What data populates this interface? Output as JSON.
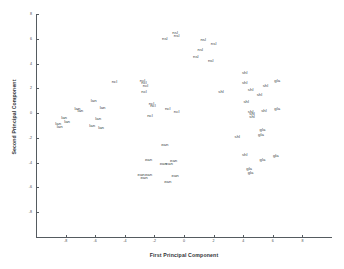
{
  "chart_data": {
    "type": "scatter",
    "title": "",
    "xlabel": "First Principal Component",
    "ylabel": "Second Principal Component",
    "xlim": [
      -10,
      10
    ],
    "ylim": [
      -10,
      8
    ],
    "xticks": [
      -8,
      -6,
      -4,
      -2,
      0,
      2,
      4,
      6,
      8
    ],
    "xtick_labels": [
      "-8",
      "-6",
      "-4",
      "-2",
      "0",
      "2",
      "4",
      "6",
      "8"
    ],
    "yticks": [
      -8,
      -6,
      -4,
      -2,
      0,
      2,
      4,
      6,
      8
    ],
    "ytick_labels": [
      "-8",
      "-6",
      "-4",
      "-2",
      "0",
      "2",
      "4",
      "6",
      "8"
    ],
    "grid": false,
    "legend": false,
    "marker": "text-label",
    "groups": [
      "lan",
      "ncl",
      "nsl",
      "ean",
      "shl",
      "gla"
    ],
    "points": [
      {
        "label": "nsl",
        "x": -0.6,
        "y": 6.5
      },
      {
        "label": "nsl",
        "x": -0.5,
        "y": 6.2
      },
      {
        "label": "nsl",
        "x": -1.3,
        "y": 6.0
      },
      {
        "label": "nsl",
        "x": 1.3,
        "y": 5.9
      },
      {
        "label": "nsl",
        "x": 2.0,
        "y": 5.6
      },
      {
        "label": "nsl",
        "x": 1.1,
        "y": 5.1
      },
      {
        "label": "nsl",
        "x": 0.8,
        "y": 4.5
      },
      {
        "label": "nsl",
        "x": 1.8,
        "y": 4.2
      },
      {
        "label": "ncl",
        "x": -2.8,
        "y": 2.6
      },
      {
        "label": "ncl",
        "x": -2.7,
        "y": 2.4
      },
      {
        "label": "ncl",
        "x": -2.6,
        "y": 2.2
      },
      {
        "label": "ncl",
        "x": -4.7,
        "y": 2.5
      },
      {
        "label": "ncl",
        "x": -2.7,
        "y": 1.7
      },
      {
        "label": "ncl",
        "x": -2.2,
        "y": 0.7
      },
      {
        "label": "ncl",
        "x": -2.1,
        "y": 0.6
      },
      {
        "label": "ncl",
        "x": -1.1,
        "y": 0.3
      },
      {
        "label": "ncl",
        "x": -0.5,
        "y": 0.1
      },
      {
        "label": "ncl",
        "x": -2.3,
        "y": -0.2
      },
      {
        "label": "lan",
        "x": -8.1,
        "y": -0.4
      },
      {
        "label": "lan",
        "x": -7.9,
        "y": -0.7
      },
      {
        "label": "lan",
        "x": -8.5,
        "y": -0.9
      },
      {
        "label": "lan",
        "x": -8.4,
        "y": -1.1
      },
      {
        "label": "lan",
        "x": -7.2,
        "y": 0.3
      },
      {
        "label": "lan",
        "x": -7.0,
        "y": 0.2
      },
      {
        "label": "lan",
        "x": -6.1,
        "y": 1.0
      },
      {
        "label": "lan",
        "x": -5.5,
        "y": 0.4
      },
      {
        "label": "lan",
        "x": -6.2,
        "y": -1.0
      },
      {
        "label": "lan",
        "x": -5.8,
        "y": -0.5
      },
      {
        "label": "lan",
        "x": -5.6,
        "y": -1.2
      },
      {
        "label": "ean",
        "x": -1.3,
        "y": -2.6
      },
      {
        "label": "ean",
        "x": -2.4,
        "y": -3.8
      },
      {
        "label": "ean",
        "x": -1.4,
        "y": -4.1
      },
      {
        "label": "ean",
        "x": -1.0,
        "y": -4.1
      },
      {
        "label": "ean",
        "x": -0.7,
        "y": -3.9
      },
      {
        "label": "ean",
        "x": -2.9,
        "y": -5.0
      },
      {
        "label": "ean",
        "x": -2.7,
        "y": -5.2
      },
      {
        "label": "ean",
        "x": -2.4,
        "y": -5.0
      },
      {
        "label": "ean",
        "x": -0.6,
        "y": -5.1
      },
      {
        "label": "ean",
        "x": -1.1,
        "y": -5.6
      },
      {
        "label": "shl",
        "x": 4.1,
        "y": 3.2
      },
      {
        "label": "shl",
        "x": 4.1,
        "y": 2.4
      },
      {
        "label": "shl",
        "x": 4.5,
        "y": 1.9
      },
      {
        "label": "shl",
        "x": 5.1,
        "y": 1.5
      },
      {
        "label": "shl",
        "x": 5.5,
        "y": 2.2
      },
      {
        "label": "shl",
        "x": 4.2,
        "y": 0.9
      },
      {
        "label": "shl",
        "x": 2.5,
        "y": 1.7
      },
      {
        "label": "shl",
        "x": 4.5,
        "y": 0.1
      },
      {
        "label": "shl",
        "x": 4.6,
        "y": -0.1
      },
      {
        "label": "shl",
        "x": 4.6,
        "y": -0.3
      },
      {
        "label": "shl",
        "x": 5.4,
        "y": 0.2
      },
      {
        "label": "shl",
        "x": 3.6,
        "y": -1.9
      },
      {
        "label": "shl",
        "x": 4.1,
        "y": -3.4
      },
      {
        "label": "gla",
        "x": 6.3,
        "y": 2.6
      },
      {
        "label": "gla",
        "x": 6.3,
        "y": 0.3
      },
      {
        "label": "gla",
        "x": 5.3,
        "y": -1.4
      },
      {
        "label": "gla",
        "x": 5.2,
        "y": -1.8
      },
      {
        "label": "gla",
        "x": 6.2,
        "y": -3.5
      },
      {
        "label": "gla",
        "x": 5.3,
        "y": -3.8
      },
      {
        "label": "gla",
        "x": 4.4,
        "y": -4.5
      },
      {
        "label": "gla",
        "x": 4.5,
        "y": -4.8
      }
    ]
  },
  "axes": {
    "xlabel_text": "First Principal Component",
    "ylabel_text": "Second Principal Component"
  }
}
